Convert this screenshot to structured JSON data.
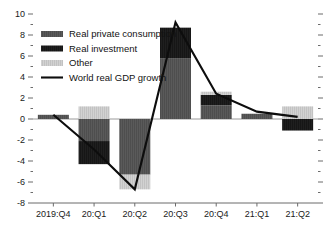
{
  "chart_data": {
    "type": "bar",
    "title": "",
    "subtitle": "",
    "xlabel": "",
    "ylabel": "",
    "stacked": true,
    "grid": false,
    "legend_position": "top-left",
    "ylim": [
      -8,
      10
    ],
    "y_major_ticks": [
      10,
      8,
      6,
      4,
      2,
      0,
      -2,
      -4,
      -6,
      -8
    ],
    "y_major_tick_labels": [
      "10",
      "8",
      "6",
      "4",
      "2",
      "0",
      "-2",
      "-4",
      "-6",
      "-8"
    ],
    "y_minor_ticks": [
      9,
      7,
      5,
      3,
      1,
      -1,
      -3,
      -5,
      -7
    ],
    "categories": [
      "2019:Q4",
      "20:Q1",
      "20:Q2",
      "20:Q3",
      "20:Q4",
      "21:Q1",
      "21:Q2"
    ],
    "series": [
      {
        "name": "Real private consumption",
        "type": "bar",
        "color": "#5a5a5a",
        "values": [
          0.4,
          -2.1,
          -5.3,
          5.8,
          1.3,
          0.5,
          0.0
        ]
      },
      {
        "name": "Real investment",
        "type": "bar",
        "color": "#1f1f1f",
        "values": [
          0.0,
          -2.2,
          0.0,
          2.9,
          1.0,
          0.0,
          -1.1
        ]
      },
      {
        "name": "Other",
        "type": "bar",
        "color": "#d2d2d2",
        "values": [
          0.0,
          1.2,
          -1.4,
          0.0,
          0.3,
          0.0,
          1.2
        ]
      },
      {
        "name": "World real GDP growth",
        "type": "line",
        "color": "#0d0d0d",
        "values": [
          0.4,
          -2.9,
          -6.7,
          9.2,
          2.4,
          0.7,
          0.2
        ]
      }
    ],
    "legend_entries": [
      {
        "label": "Real private consumption",
        "marker": "bar",
        "color": "#5a5a5a"
      },
      {
        "label": "Real investment",
        "marker": "bar",
        "color": "#1f1f1f"
      },
      {
        "label": "Other",
        "marker": "bar",
        "color": "#d2d2d2"
      },
      {
        "label": "World real GDP growth",
        "marker": "line",
        "color": "#0d0d0d"
      }
    ],
    "colors": {
      "consumption": "#5a5a5a",
      "investment": "#1f1f1f",
      "other": "#d2d2d2",
      "line": "#0d0d0d",
      "axis": "#6b6b6b",
      "text": "#1a1a1a",
      "background": "#ffffff"
    }
  }
}
